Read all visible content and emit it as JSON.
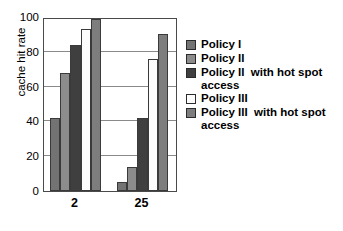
{
  "chart_data": {
    "type": "bar",
    "title": "",
    "xlabel": "",
    "ylabel": "cache hit rate",
    "categories": [
      "2",
      "25"
    ],
    "ylim": [
      0,
      100
    ],
    "yticks": [
      0,
      20,
      40,
      60,
      80,
      100
    ],
    "grid": true,
    "legend_position": "right",
    "series": [
      {
        "name": "Policy I",
        "color": "#737373",
        "values": [
          42,
          5
        ]
      },
      {
        "name": "Policy II",
        "color": "#8c8c8c",
        "values": [
          68,
          14
        ]
      },
      {
        "name": "Policy II  with hot spot access",
        "color": "#3f3f3f",
        "values": [
          84,
          42
        ]
      },
      {
        "name": "Policy III",
        "color": "#fcfcfc",
        "values": [
          93,
          76
        ]
      },
      {
        "name": "Policy III  with hot spot access",
        "color": "#7d7d7d",
        "values": [
          99,
          90
        ]
      }
    ]
  },
  "axis": {
    "y_tick_labels": [
      "100",
      "80",
      "60",
      "40",
      "20",
      "0"
    ],
    "x_tick_labels": [
      "2",
      "25"
    ]
  },
  "legend": {
    "items": [
      {
        "label": "Policy I"
      },
      {
        "label": "Policy II"
      },
      {
        "label": "Policy II  with hot spot\naccess"
      },
      {
        "label": "Policy III"
      },
      {
        "label": "Policy III  with hot spot\naccess"
      }
    ]
  }
}
